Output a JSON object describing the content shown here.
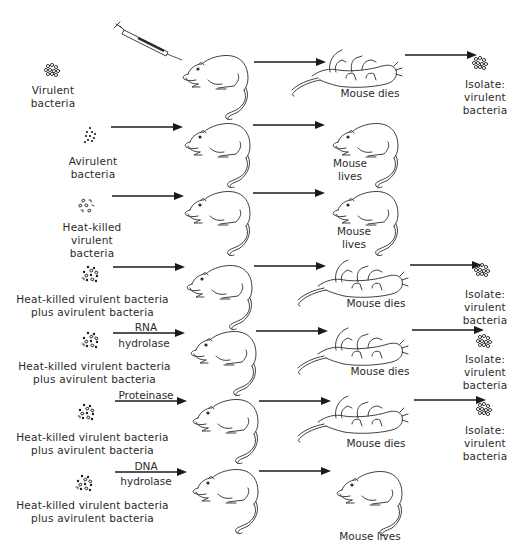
{
  "diagram": {
    "rows": [
      {
        "id": "row1",
        "inoculum_label": [
          "Virulent",
          "bacteria"
        ],
        "inoculum_icon": "virulent-bacteria-cluster-icon",
        "treatment": null,
        "outcome": "Mouse dies",
        "isolate": [
          "Isolate:",
          "virulent",
          "bacteria"
        ],
        "has_syringe": true
      },
      {
        "id": "row2",
        "inoculum_label": [
          "Avirulent",
          "bacteria"
        ],
        "inoculum_icon": "avirulent-bacteria-cluster-icon",
        "treatment": null,
        "outcome": [
          "Mouse",
          "lives"
        ],
        "isolate": null
      },
      {
        "id": "row3",
        "inoculum_label": [
          "Heat-killed",
          "virulent",
          "bacteria"
        ],
        "inoculum_icon": "heat-killed-bacteria-cluster-icon",
        "treatment": null,
        "outcome": [
          "Mouse",
          "lives"
        ],
        "isolate": null
      },
      {
        "id": "row4",
        "inoculum_label": [
          "Heat-killed virulent bacteria",
          "plus avirulent bacteria"
        ],
        "inoculum_icon": "mixed-bacteria-cluster-icon",
        "treatment": null,
        "outcome": "Mouse dies",
        "isolate": [
          "Isolate:",
          "virulent",
          "bacteria"
        ]
      },
      {
        "id": "row5",
        "inoculum_label": [
          "Heat-killed virulent bacteria",
          "plus avirulent bacteria"
        ],
        "inoculum_icon": "mixed-bacteria-cluster-icon",
        "treatment": [
          "RNA",
          "hydrolase"
        ],
        "outcome": "Mouse dies",
        "isolate": [
          "Isolate:",
          "virulent",
          "bacteria"
        ]
      },
      {
        "id": "row6",
        "inoculum_label": [
          "Heat-killed virulent bacteria",
          "plus avirulent bacteria"
        ],
        "inoculum_icon": "mixed-bacteria-cluster-icon",
        "treatment": [
          "Proteinase"
        ],
        "outcome": "Mouse dies",
        "isolate": [
          "Isolate:",
          "virulent",
          "bacteria"
        ]
      },
      {
        "id": "row7",
        "inoculum_label": [
          "Heat-killed virulent bacteria",
          "plus avirulent bacteria"
        ],
        "inoculum_icon": "mixed-bacteria-cluster-icon",
        "treatment": [
          "DNA",
          "hydrolase"
        ],
        "outcome": "Mouse lives",
        "isolate": null
      }
    ],
    "colors": {
      "ink": "#2b2b2b",
      "background": "#ffffff"
    }
  }
}
